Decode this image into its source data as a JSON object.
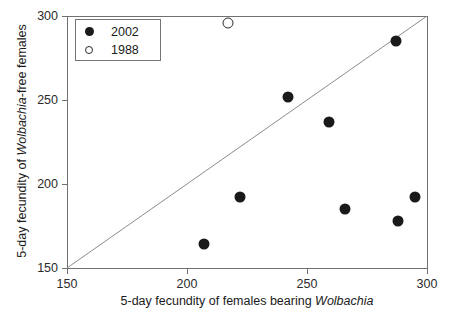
{
  "chart_data": {
    "type": "scatter",
    "title": "",
    "xlabel": "5-day fecundity of females bearing Wolbachia",
    "ylabel": "5-day fecundity of Wolbachia-free females",
    "xlim": [
      150,
      300
    ],
    "ylim": [
      150,
      300
    ],
    "xticks": [
      150,
      200,
      250,
      300
    ],
    "yticks": [
      150,
      200,
      250,
      300
    ],
    "grid": false,
    "legend_position": "top-left",
    "reference_line": {
      "name": "identity-line",
      "from": [
        150,
        150
      ],
      "to": [
        300,
        300
      ],
      "slope": 1,
      "intercept": 0
    },
    "series": [
      {
        "name": "2002",
        "marker": "filled-circle",
        "color": "#1a1a1a",
        "points": [
          {
            "x": 207,
            "y": 164
          },
          {
            "x": 222,
            "y": 192
          },
          {
            "x": 242,
            "y": 252
          },
          {
            "x": 259,
            "y": 237
          },
          {
            "x": 266,
            "y": 185
          },
          {
            "x": 287,
            "y": 285
          },
          {
            "x": 288,
            "y": 178
          },
          {
            "x": 295,
            "y": 192
          }
        ]
      },
      {
        "name": "1988",
        "marker": "open-circle",
        "color": "#2b2b2b",
        "points": [
          {
            "x": 217,
            "y": 296
          }
        ]
      }
    ]
  },
  "axes": {
    "x_title_parts": {
      "pre": "5-day fecundity of females bearing ",
      "italic": "Wolbachia",
      "post": ""
    },
    "y_title_parts": {
      "pre": "5-day fecundity of ",
      "italic": "Wolbachia",
      "post": "-free females"
    },
    "x_tick_labels": [
      "150",
      "200",
      "250",
      "300"
    ],
    "y_tick_labels": [
      "150",
      "200",
      "250",
      "300"
    ]
  },
  "legend": {
    "entries": [
      {
        "label": "2002",
        "marker": "filled-circle"
      },
      {
        "label": "1988",
        "marker": "open-circle"
      }
    ]
  },
  "colors": {
    "axis": "#6f7072",
    "marker_filled": "#1a1a1a",
    "marker_open_border": "#2b2b2b",
    "reference_line": "#8a8b8d",
    "text": "#1a1a1a",
    "background": "#ffffff"
  }
}
